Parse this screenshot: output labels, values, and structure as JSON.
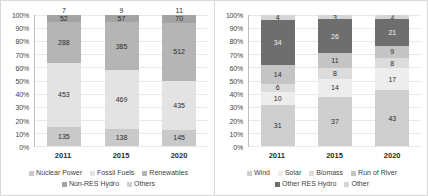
{
  "chart_data": [
    {
      "type": "bar",
      "stacked": "100%",
      "title": "",
      "xlabel": "",
      "ylabel": "",
      "categories": [
        "2011",
        "2015",
        "2020"
      ],
      "ylim": [
        0,
        100
      ],
      "ytick_labels": [
        "0%",
        "10%",
        "20%",
        "30%",
        "40%",
        "50%",
        "60%",
        "70%",
        "80%",
        "90%",
        "100%"
      ],
      "grid": true,
      "legend_position": "bottom",
      "series": [
        {
          "name": "Nuclear Power",
          "color": "#c9c9c9",
          "values": [
            135,
            138,
            145
          ]
        },
        {
          "name": "Fossil Fuels",
          "color": "#e3e3e3",
          "values": [
            453,
            469,
            435
          ]
        },
        {
          "name": "Renewables",
          "color": "#b5b5b5",
          "values": [
            288,
            385,
            512
          ]
        },
        {
          "name": "Non-RES Hydro",
          "color": "#a3a3a3",
          "values": [
            52,
            57,
            70
          ]
        },
        {
          "name": "Others",
          "color": "#d0d0d0",
          "values": [
            7,
            9,
            11
          ]
        }
      ],
      "outside_labels": [
        "7",
        "9",
        "11"
      ]
    },
    {
      "type": "bar",
      "stacked": "100%",
      "title": "",
      "xlabel": "",
      "ylabel": "",
      "categories": [
        "2011",
        "2015",
        "2020"
      ],
      "ylim": [
        0,
        100
      ],
      "ytick_labels": [
        "0%",
        "10%",
        "20%",
        "30%",
        "40%",
        "50%",
        "60%",
        "70%",
        "80%",
        "90%",
        "100%"
      ],
      "grid": true,
      "legend_position": "bottom",
      "series": [
        {
          "name": "Wind",
          "color": "#cfcfcf",
          "values": [
            31,
            37,
            43
          ]
        },
        {
          "name": "Solar",
          "color": "#ededed",
          "values": [
            10,
            14,
            17
          ]
        },
        {
          "name": "Biomass",
          "color": "#dcdcdc",
          "values": [
            6,
            8,
            8
          ]
        },
        {
          "name": "Run of River",
          "color": "#c4c4c4",
          "values": [
            14,
            11,
            9
          ]
        },
        {
          "name": "Other RES Hydro",
          "color": "#6e6e6e",
          "values": [
            34,
            26,
            21
          ]
        },
        {
          "name": "Other",
          "color": "#d6d6d6",
          "values": [
            4,
            3,
            3
          ]
        }
      ]
    }
  ],
  "left_chart": {
    "name": "electricity-generation-mix-chart",
    "yticks": [
      "100%",
      "90%",
      "80%",
      "70%",
      "60%",
      "50%",
      "40%",
      "30%",
      "20%",
      "10%",
      "0%"
    ],
    "xlabels": [
      "2011",
      "2015",
      "2020"
    ],
    "legend": [
      "Nuclear Power",
      "Fossil Fuels",
      "Renewables",
      "Non-RES Hydro",
      "Others"
    ],
    "bars": [
      {
        "year": "2011",
        "cap": "7",
        "segments": [
          {
            "label": "135",
            "value": 135,
            "pct": 14.6,
            "tone": "light"
          },
          {
            "label": "453",
            "value": 453,
            "pct": 48.9,
            "tone": "light"
          },
          {
            "label": "288",
            "value": 288,
            "pct": 31.1,
            "tone": "light"
          },
          {
            "label": "52",
            "value": 52,
            "pct": 5.6,
            "tone": "light"
          }
        ]
      },
      {
        "year": "2015",
        "cap": "9",
        "segments": [
          {
            "label": "138",
            "value": 138,
            "pct": 12.8,
            "tone": "light"
          },
          {
            "label": "469",
            "value": 469,
            "pct": 43.6,
            "tone": "light"
          },
          {
            "label": "385",
            "value": 385,
            "pct": 35.8,
            "tone": "light"
          },
          {
            "label": "57",
            "value": 57,
            "pct": 5.3,
            "tone": "light"
          }
        ]
      },
      {
        "year": "2020",
        "cap": "11",
        "segments": [
          {
            "label": "145",
            "value": 145,
            "pct": 12.7,
            "tone": "light"
          },
          {
            "label": "435",
            "value": 435,
            "pct": 38.1,
            "tone": "light"
          },
          {
            "label": "512",
            "value": 512,
            "pct": 44.8,
            "tone": "light"
          },
          {
            "label": "70",
            "value": 70,
            "pct": 6.1,
            "tone": "light"
          }
        ]
      }
    ]
  },
  "right_chart": {
    "name": "renewables-breakdown-chart",
    "yticks": [
      "100%",
      "90%",
      "80%",
      "70%",
      "60%",
      "50%",
      "40%",
      "30%",
      "20%",
      "10%",
      "0%"
    ],
    "xlabels": [
      "2011",
      "2015",
      "2020"
    ],
    "legend": [
      "Wind",
      "Solar",
      "Biomass",
      "Run of River",
      "Other RES Hydro",
      "Other"
    ],
    "bars": [
      {
        "year": "2011",
        "segments": [
          {
            "label": "31",
            "value": 31,
            "pct": 31,
            "tone": "light"
          },
          {
            "label": "10",
            "value": 10,
            "pct": 10,
            "tone": "light"
          },
          {
            "label": "6",
            "value": 6,
            "pct": 6,
            "tone": "light"
          },
          {
            "label": "14",
            "value": 14,
            "pct": 14,
            "tone": "light"
          },
          {
            "label": "34",
            "value": 34,
            "pct": 34,
            "tone": "dark"
          },
          {
            "label": "4",
            "value": 4,
            "pct": 4,
            "tone": "light"
          }
        ]
      },
      {
        "year": "2015",
        "segments": [
          {
            "label": "37",
            "value": 37,
            "pct": 37,
            "tone": "light"
          },
          {
            "label": "14",
            "value": 14,
            "pct": 14,
            "tone": "light"
          },
          {
            "label": "8",
            "value": 8,
            "pct": 8,
            "tone": "light"
          },
          {
            "label": "11",
            "value": 11,
            "pct": 11,
            "tone": "light"
          },
          {
            "label": "26",
            "value": 26,
            "pct": 26,
            "tone": "dark"
          },
          {
            "label": "3",
            "value": 3,
            "pct": 3,
            "tone": "light"
          }
        ]
      },
      {
        "year": "2020",
        "segments": [
          {
            "label": "43",
            "value": 43,
            "pct": 43,
            "tone": "light"
          },
          {
            "label": "17",
            "value": 17,
            "pct": 17,
            "tone": "light"
          },
          {
            "label": "8",
            "value": 8,
            "pct": 8,
            "tone": "light"
          },
          {
            "label": "9",
            "value": 9,
            "pct": 9,
            "tone": "light"
          },
          {
            "label": "21",
            "value": 21,
            "pct": 21,
            "tone": "dark"
          },
          {
            "label": "3",
            "value": 3,
            "pct": 3,
            "tone": "light"
          }
        ]
      }
    ]
  }
}
